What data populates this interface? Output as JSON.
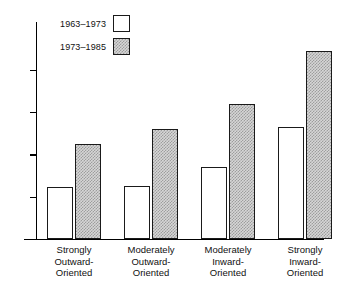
{
  "chart_data": {
    "type": "bar",
    "title": "",
    "subtitle": "",
    "xlabel": "",
    "ylabel": "",
    "categories": [
      "Strongly Outward-Oriented",
      "Moderately Outward-Oriented",
      "Moderately Inward-Oriented",
      "Strongly Inward-Oriented"
    ],
    "category_lines": [
      [
        "Strongly",
        "Outward-",
        "Oriented"
      ],
      [
        "Moderately",
        "Outward-",
        "Oriented"
      ],
      [
        "Moderately",
        "Inward-",
        "Oriented"
      ],
      [
        "Strongly",
        "Inward-",
        "Oriented"
      ]
    ],
    "series": [
      {
        "name": "1963-1973",
        "values": [
          2.45,
          2.5,
          3.4,
          5.3
        ],
        "fill": "white"
      },
      {
        "name": "1973-1985",
        "values": [
          4.5,
          5.2,
          6.4,
          8.9
        ],
        "fill": "hatched"
      }
    ],
    "ylim": [
      0,
      9.6
    ],
    "yticks": [
      0,
      2,
      4,
      6,
      8
    ],
    "ytick_labels": [
      "0",
      "2",
      "4",
      "6",
      "8"
    ],
    "grid": false,
    "legend_position": "top-left",
    "legend": [
      {
        "label": "1963–1973",
        "swatch": "white"
      },
      {
        "label": "1973–1985",
        "swatch": "hatched"
      }
    ],
    "colors": {
      "axis": "#000000",
      "bar_outline": "#1a1a1a",
      "bar_white_fill": "#ffffff",
      "bar_hatched_fill": "#d6d6d6",
      "background": "#ffffff"
    }
  }
}
